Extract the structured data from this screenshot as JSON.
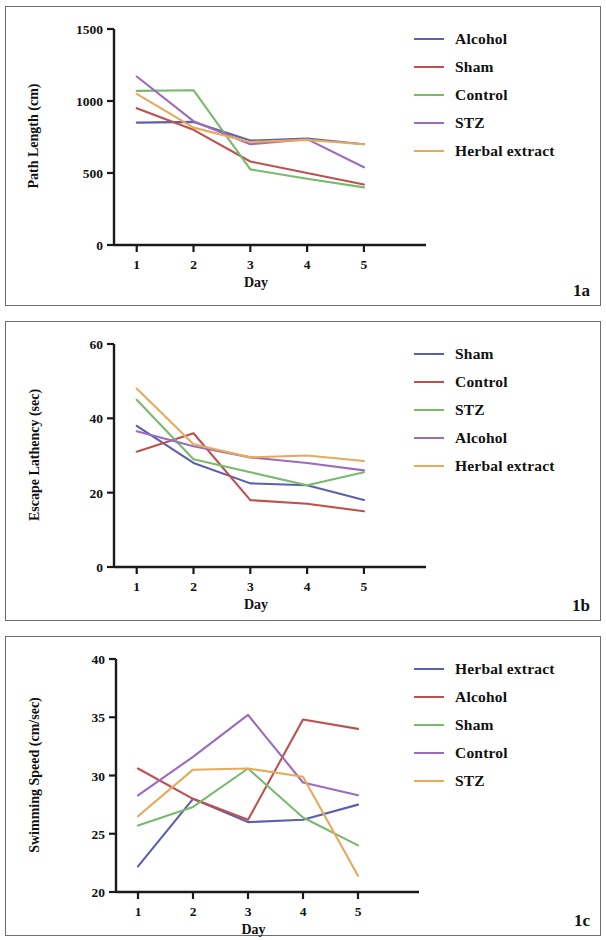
{
  "figure": {
    "panels": [
      {
        "tag": "1a",
        "xlabel": "Day",
        "ylabel": "Path Length (cm)",
        "legend": [
          {
            "label": "Alcohol",
            "color": "#5c5fb0"
          },
          {
            "label": "Sham",
            "color": "#c0504d"
          },
          {
            "label": "Control",
            "color": "#77bb6b"
          },
          {
            "label": "STZ",
            "color": "#9b6bbf"
          },
          {
            "label": "Herbal extract",
            "color": "#e8a95a"
          }
        ]
      },
      {
        "tag": "1b",
        "xlabel": "Day",
        "ylabel": "Escape Lathency (sec)",
        "legend": [
          {
            "label": "Sham",
            "color": "#5c5fb0"
          },
          {
            "label": "Control",
            "color": "#c0504d"
          },
          {
            "label": "STZ",
            "color": "#77bb6b"
          },
          {
            "label": "Alcohol",
            "color": "#9b6bbf"
          },
          {
            "label": "Herbal extract",
            "color": "#e8a95a"
          }
        ]
      },
      {
        "tag": "1c",
        "xlabel": "Day",
        "ylabel": "Swimming Speed (cm/sec)",
        "legend": [
          {
            "label": "Herbal extract",
            "color": "#5c5fb0"
          },
          {
            "label": "Alcohol",
            "color": "#c0504d"
          },
          {
            "label": "Sham",
            "color": "#77bb6b"
          },
          {
            "label": "Control",
            "color": "#9b6bbf"
          },
          {
            "label": "STZ",
            "color": "#e8a95a"
          }
        ]
      }
    ]
  },
  "chart_data": [
    {
      "type": "line",
      "panel": "1a",
      "title": "",
      "xlabel": "Day",
      "ylabel": "Path Length (cm)",
      "x": [
        1,
        2,
        3,
        4,
        5
      ],
      "xticklabels": [
        "1",
        "2",
        "3",
        "4",
        "5"
      ],
      "yticks": [
        0,
        500,
        1000,
        1500
      ],
      "yticklabels": [
        "0",
        "500",
        "1000",
        "1500"
      ],
      "ylim": [
        0,
        1500
      ],
      "xlim": [
        0.6,
        5.6
      ],
      "grid": false,
      "legend_position": "right",
      "series": [
        {
          "name": "Alcohol",
          "color": "#5c5fb0",
          "values": [
            850,
            855,
            725,
            740,
            700
          ]
        },
        {
          "name": "Sham",
          "color": "#c0504d",
          "values": [
            950,
            800,
            580,
            500,
            420
          ]
        },
        {
          "name": "Control",
          "color": "#77bb6b",
          "values": [
            1070,
            1075,
            525,
            460,
            400
          ]
        },
        {
          "name": "STZ",
          "color": "#9b6bbf",
          "values": [
            1170,
            860,
            700,
            735,
            540
          ]
        },
        {
          "name": "Herbal extract",
          "color": "#e8a95a",
          "values": [
            1050,
            815,
            715,
            730,
            700
          ]
        }
      ]
    },
    {
      "type": "line",
      "panel": "1b",
      "title": "",
      "xlabel": "Day",
      "ylabel": "Escape Lathency (sec)",
      "x": [
        1,
        2,
        3,
        4,
        5
      ],
      "xticklabels": [
        "1",
        "2",
        "3",
        "4",
        "5"
      ],
      "yticks": [
        0,
        20,
        40,
        60
      ],
      "yticklabels": [
        "0",
        "20",
        "40",
        "60"
      ],
      "ylim": [
        0,
        60
      ],
      "xlim": [
        0.6,
        5.6
      ],
      "grid": false,
      "legend_position": "right",
      "series": [
        {
          "name": "Sham",
          "color": "#5c5fb0",
          "values": [
            38,
            28,
            22.5,
            22,
            18
          ]
        },
        {
          "name": "Control",
          "color": "#c0504d",
          "values": [
            31,
            36,
            18,
            17,
            15
          ]
        },
        {
          "name": "STZ",
          "color": "#77bb6b",
          "values": [
            45,
            29,
            25.5,
            22,
            25.5
          ]
        },
        {
          "name": "Alcohol",
          "color": "#9b6bbf",
          "values": [
            36.5,
            32.5,
            29.5,
            28,
            26
          ]
        },
        {
          "name": "Herbal extract",
          "color": "#e8a95a",
          "values": [
            48,
            33,
            29.5,
            30,
            28.5
          ]
        }
      ]
    },
    {
      "type": "line",
      "panel": "1c",
      "title": "",
      "xlabel": "Day",
      "ylabel": "Swimming Speed (cm/sec)",
      "x": [
        1,
        2,
        3,
        4,
        5
      ],
      "xticklabels": [
        "1",
        "2",
        "3",
        "4",
        "5"
      ],
      "yticks": [
        20,
        25,
        30,
        35,
        40
      ],
      "yticklabels": [
        "20",
        "25",
        "30",
        "35",
        "40"
      ],
      "ylim": [
        20,
        40
      ],
      "xlim": [
        0.6,
        5.6
      ],
      "grid": false,
      "legend_position": "right",
      "series": [
        {
          "name": "Herbal extract",
          "color": "#5c5fb0",
          "values": [
            22.2,
            28,
            26,
            26.2,
            27.5
          ]
        },
        {
          "name": "Alcohol",
          "color": "#c0504d",
          "values": [
            30.6,
            28,
            26.2,
            34.8,
            34
          ]
        },
        {
          "name": "Sham",
          "color": "#77bb6b",
          "values": [
            25.7,
            27.3,
            30.6,
            26.4,
            24
          ]
        },
        {
          "name": "Control",
          "color": "#9b6bbf",
          "values": [
            28.3,
            31.6,
            35.2,
            29.4,
            28.3
          ]
        },
        {
          "name": "STZ",
          "color": "#e8a95a",
          "values": [
            26.5,
            30.5,
            30.6,
            29.9,
            21.4
          ]
        }
      ]
    }
  ]
}
